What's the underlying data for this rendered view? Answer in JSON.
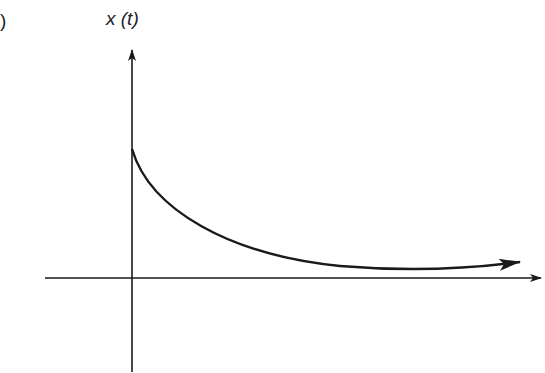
{
  "figure": {
    "panel_label_fragment": ")",
    "y_axis_label": "x (t)",
    "curve_description": "decaying exponential",
    "colors": {
      "line": "#1a1a1a",
      "background": "#ffffff"
    }
  }
}
